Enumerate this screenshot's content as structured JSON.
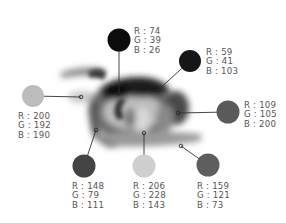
{
  "diagram": {
    "type": "color-sampling-callouts",
    "swatches": [
      {
        "id": "top",
        "r": 74,
        "g": 39,
        "b": 26,
        "display_gray": "#0c0c0c",
        "circle": {
          "cx": 119,
          "cy": 40,
          "rad": 11.5
        },
        "anchor": {
          "x": 119,
          "y": 93
        },
        "label_pos": {
          "x": 134,
          "y": 27
        }
      },
      {
        "id": "upper-right",
        "r": 59,
        "g": 41,
        "b": 103,
        "display_gray": "#161616",
        "circle": {
          "cx": 190,
          "cy": 61,
          "rad": 11
        },
        "anchor": {
          "x": 158,
          "y": 90
        },
        "label_pos": {
          "x": 206,
          "y": 48
        }
      },
      {
        "id": "left",
        "r": 200,
        "g": 192,
        "b": 190,
        "display_gray": "#bcbcbc",
        "circle": {
          "cx": 33,
          "cy": 96,
          "rad": 11
        },
        "anchor": {
          "x": 81,
          "y": 97
        },
        "label_pos": {
          "x": 18,
          "y": 112
        }
      },
      {
        "id": "right",
        "r": 109,
        "g": 105,
        "b": 200,
        "display_gray": "#5a5a5a",
        "circle": {
          "cx": 228,
          "cy": 112,
          "rad": 11.5
        },
        "anchor": {
          "x": 178,
          "y": 113
        },
        "label_pos": {
          "x": 244,
          "y": 101
        }
      },
      {
        "id": "bottom-left",
        "r": 148,
        "g": 79,
        "b": 111,
        "display_gray": "#444444",
        "circle": {
          "cx": 84,
          "cy": 166,
          "rad": 11.5
        },
        "anchor": {
          "x": 96,
          "y": 130
        },
        "label_pos": {
          "x": 72,
          "y": 182
        }
      },
      {
        "id": "bottom-center",
        "r": 206,
        "g": 228,
        "b": 143,
        "display_gray": "#cfcfcf",
        "circle": {
          "cx": 144,
          "cy": 166,
          "rad": 11.5
        },
        "anchor": {
          "x": 144,
          "y": 133
        },
        "label_pos": {
          "x": 133,
          "y": 182
        }
      },
      {
        "id": "bottom-right",
        "r": 159,
        "g": 121,
        "b": 73,
        "display_gray": "#5e5e5e",
        "circle": {
          "cx": 208,
          "cy": 165,
          "rad": 11.5
        },
        "anchor": {
          "x": 181,
          "y": 146
        },
        "label_pos": {
          "x": 197,
          "y": 182
        }
      }
    ],
    "labels": {
      "top": [
        "R : 74",
        "G : 39",
        "B : 26"
      ],
      "upper-right": [
        "R : 59",
        "G : 41",
        "B : 103"
      ],
      "left": [
        "R : 200",
        "G : 192",
        "B : 190"
      ],
      "right": [
        "R : 109",
        "G : 105",
        "B : 200"
      ],
      "bottom-left": [
        "R : 148",
        "G : 79",
        "B : 111"
      ],
      "bottom-center": [
        "R : 206",
        "G : 228",
        "B : 143"
      ],
      "bottom-right": [
        "R : 159",
        "G : 121",
        "B : 73"
      ]
    },
    "line_color": "#333333",
    "text_color": "#555555"
  }
}
